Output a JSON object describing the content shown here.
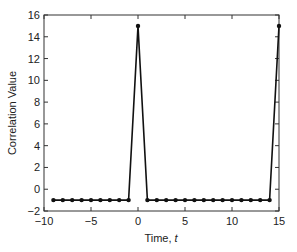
{
  "chart_data": {
    "type": "line",
    "title": "",
    "xlabel": "Time, ",
    "xlabel_italic": "t",
    "ylabel": "Correlation Value",
    "xlim": [
      -10,
      15
    ],
    "ylim": [
      -2,
      16
    ],
    "x_ticks": [
      -10,
      -5,
      0,
      5,
      10,
      15
    ],
    "x_tick_labels": [
      "−10",
      "−5",
      "0",
      "5",
      "10",
      "15"
    ],
    "y_ticks": [
      -2,
      0,
      2,
      4,
      6,
      8,
      10,
      12,
      14,
      16
    ],
    "y_tick_labels": [
      "−2",
      "0",
      "2",
      "4",
      "6",
      "8",
      "10",
      "12",
      "14",
      "16"
    ],
    "grid": false,
    "legend": null,
    "series": [
      {
        "name": "Correlation",
        "marker": "dot",
        "color": "#111111",
        "x": [
          -9,
          -8,
          -7,
          -6,
          -5,
          -4,
          -3,
          -2,
          -1,
          0,
          1,
          2,
          3,
          4,
          5,
          6,
          7,
          8,
          9,
          10,
          11,
          12,
          13,
          14,
          15
        ],
        "y": [
          -1,
          -1,
          -1,
          -1,
          -1,
          -1,
          -1,
          -1,
          -1,
          15,
          -1,
          -1,
          -1,
          -1,
          -1,
          -1,
          -1,
          -1,
          -1,
          -1,
          -1,
          -1,
          -1,
          -1,
          15
        ]
      }
    ]
  },
  "layout": {
    "plot_left": 44,
    "plot_right": 279,
    "plot_top": 15,
    "plot_bottom": 211,
    "line_color": "#111111",
    "frame_color": "#333333"
  }
}
